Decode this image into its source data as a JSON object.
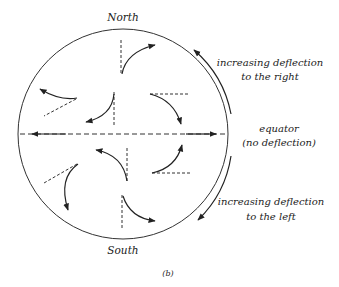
{
  "figure": {
    "caption": "(b)",
    "labels": {
      "north": "North",
      "south": "South",
      "right_line1": "increasing deflection",
      "right_line2": "to the right",
      "equator_line1": "equator",
      "equator_line2": "(no deflection)",
      "left_line1": "increasing deflection",
      "left_line2": "to the left"
    },
    "colors": {
      "ink": "#222222",
      "background": "#ffffff"
    }
  }
}
